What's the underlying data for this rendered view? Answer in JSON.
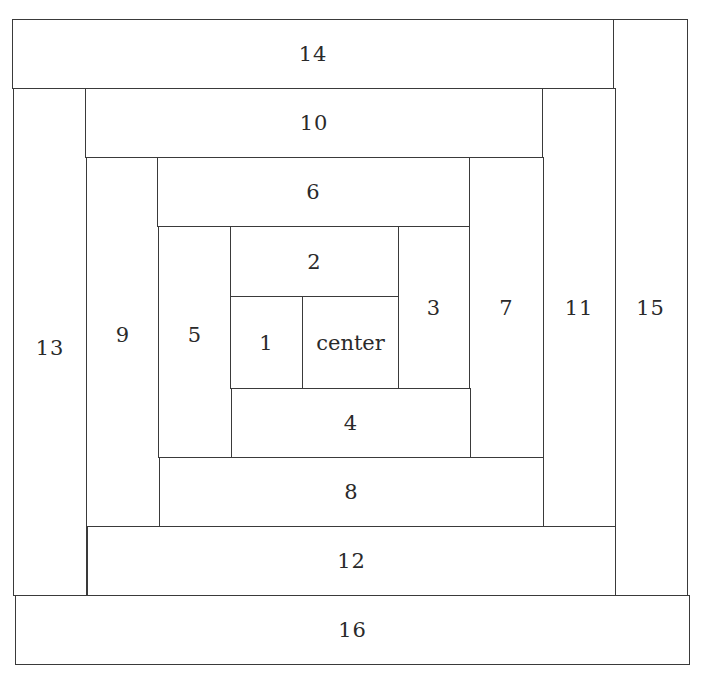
{
  "diagram": {
    "type": "log-cabin-quilt-block",
    "line_color": "#3a3a3a",
    "background": "#ffffff",
    "pieces": [
      {
        "id": "14",
        "label": "14"
      },
      {
        "id": "15",
        "label": "15"
      },
      {
        "id": "13",
        "label": "13"
      },
      {
        "id": "16",
        "label": "16"
      },
      {
        "id": "10",
        "label": "10"
      },
      {
        "id": "11",
        "label": "11"
      },
      {
        "id": "12",
        "label": "12"
      },
      {
        "id": "9",
        "label": "9"
      },
      {
        "id": "6",
        "label": "6"
      },
      {
        "id": "7",
        "label": "7"
      },
      {
        "id": "8",
        "label": "8"
      },
      {
        "id": "5",
        "label": "5"
      },
      {
        "id": "2",
        "label": "2"
      },
      {
        "id": "3",
        "label": "3"
      },
      {
        "id": "4",
        "label": "4"
      },
      {
        "id": "1",
        "label": "1"
      },
      {
        "id": "center",
        "label": "center"
      }
    ]
  }
}
